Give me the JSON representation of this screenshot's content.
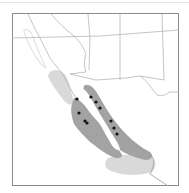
{
  "map": {
    "type": "species range map",
    "region": "Baja California / Gulf of California / southwestern USA & northwestern Mexico",
    "colors": {
      "background": "#ffffff",
      "frame": "#8a8a8a",
      "borders": "#b5b5b5",
      "coastline": "#9a9a9a",
      "range_primary": "#a3a3a3",
      "range_secondary": "#d9d9d9",
      "locality_dot": "#111111"
    },
    "legend_items": [
      {
        "name": "primary-range",
        "color": "#a3a3a3"
      },
      {
        "name": "secondary-range",
        "color": "#d9d9d9"
      },
      {
        "name": "locality-record",
        "color": "#111111"
      }
    ],
    "localities": [
      {
        "x": 77,
        "y": 99
      },
      {
        "x": 79,
        "y": 113
      },
      {
        "x": 85,
        "y": 121
      },
      {
        "x": 87,
        "y": 123
      },
      {
        "x": 91,
        "y": 97
      },
      {
        "x": 96,
        "y": 102
      },
      {
        "x": 100,
        "y": 108
      },
      {
        "x": 111,
        "y": 121
      },
      {
        "x": 114,
        "y": 128
      },
      {
        "x": 117,
        "y": 134
      }
    ]
  }
}
